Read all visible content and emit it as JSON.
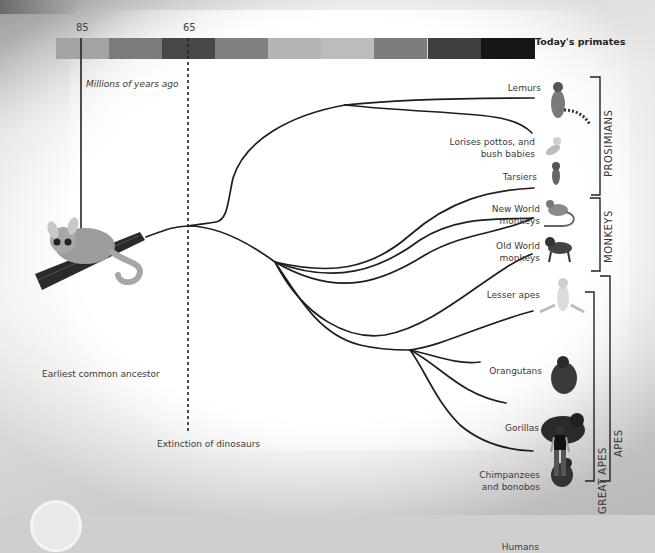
{
  "diagram": {
    "timeline": {
      "ticks": [
        {
          "label": "85",
          "x": 81
        },
        {
          "label": "65",
          "x": 188
        }
      ],
      "axis_label": "Millions of years ago",
      "end_label": "Today's primates",
      "segment_colors": [
        "#a3a3a3",
        "#7b7b7b",
        "#474747",
        "#808080",
        "#b4b4b4",
        "#bcbcbc",
        "#7c7c7c",
        "#3f3f3f",
        "#161616"
      ]
    },
    "ancestor": {
      "label": "Earliest common ancestor",
      "icon": "bushbaby-on-branch-icon"
    },
    "event": {
      "label": "Extinction of dinosaurs"
    },
    "species": [
      {
        "id": "lemurs",
        "label": "Lemurs",
        "icon": "lemur-icon"
      },
      {
        "id": "lorises",
        "label_line1": "Lorises pottos, and",
        "label_line2": "bush babies",
        "icon": "loris-icon"
      },
      {
        "id": "tarsiers",
        "label": "Tarsiers",
        "icon": "tarsier-icon"
      },
      {
        "id": "new-world",
        "label_line1": "New World",
        "label_line2": "monkeys",
        "icon": "new-world-monkey-icon"
      },
      {
        "id": "old-world",
        "label_line1": "Old World",
        "label_line2": "monkeys",
        "icon": "baboon-icon"
      },
      {
        "id": "lesser-apes",
        "label": "Lesser apes",
        "icon": "gibbon-icon"
      },
      {
        "id": "orangutans",
        "label": "Orangutans",
        "icon": "orangutan-icon"
      },
      {
        "id": "gorillas",
        "label": "Gorillas",
        "icon": "gorilla-icon"
      },
      {
        "id": "chimps",
        "label_line1": "Chimpanzees",
        "label_line2": "and bonobos",
        "icon": "chimpanzee-icon"
      },
      {
        "id": "humans",
        "label": "Humans",
        "icon": "human-icon"
      }
    ],
    "groups": [
      {
        "label": "PROSIMIANS"
      },
      {
        "label": "MONKEYS"
      },
      {
        "label": "GREAT APES"
      },
      {
        "label": "APES"
      }
    ]
  }
}
